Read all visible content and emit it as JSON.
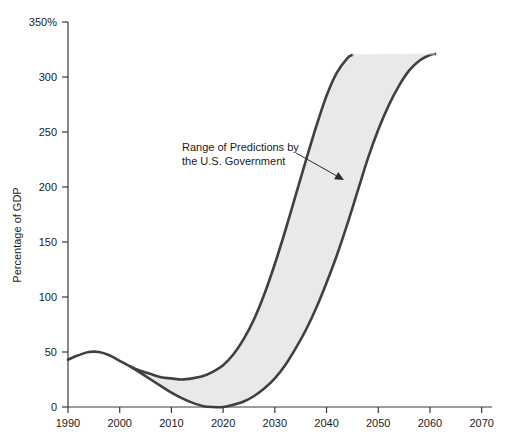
{
  "chart_data": {
    "type": "area",
    "title": "",
    "subtitle": "",
    "xlabel": "",
    "ylabel": "Percentage of GDP",
    "xlim": [
      1990,
      2072
    ],
    "ylim": [
      0,
      350
    ],
    "grid": false,
    "legend_position": "none",
    "x_ticks": [
      1990,
      2000,
      2010,
      2020,
      2030,
      2040,
      2050,
      2060,
      2070
    ],
    "x_tick_labels": [
      "1990",
      "2000",
      "2010",
      "2020",
      "2030",
      "2040",
      "2050",
      "2060",
      "2070"
    ],
    "y_ticks": [
      0,
      50,
      100,
      150,
      200,
      250,
      300,
      350
    ],
    "y_tick_labels": [
      "0",
      "50",
      "100",
      "150",
      "200",
      "250",
      "300",
      "350%"
    ],
    "band_fill_color": "#e9e9e9",
    "line_color": "#404040",
    "axis_color": "#3a3a3a",
    "series": [
      {
        "name": "Historical / Upper Bound of Predictions",
        "role": "upper",
        "x": [
          1990,
          1992,
          1994,
          1996,
          1998,
          2000,
          2002,
          2004,
          2006,
          2008,
          2010,
          2012,
          2014,
          2016,
          2018,
          2020,
          2022,
          2024,
          2026,
          2028,
          2030,
          2032,
          2034,
          2036,
          2038,
          2040,
          2042,
          2044,
          2045
        ],
        "values": [
          43,
          47,
          50,
          50,
          47,
          42,
          37,
          33,
          30,
          27,
          26,
          25,
          26,
          28,
          32,
          38,
          48,
          62,
          80,
          103,
          130,
          160,
          192,
          224,
          255,
          283,
          304,
          317,
          320
        ]
      },
      {
        "name": "Lower Bound of Predictions",
        "role": "lower",
        "x": [
          2002,
          2004,
          2006,
          2008,
          2010,
          2012,
          2014,
          2016,
          2018,
          2020,
          2022,
          2024,
          2026,
          2028,
          2030,
          2032,
          2034,
          2036,
          2038,
          2040,
          2042,
          2044,
          2046,
          2048,
          2050,
          2052,
          2054,
          2056,
          2058,
          2060,
          2061
        ],
        "values": [
          37,
          31,
          25,
          19,
          13,
          8,
          4,
          1,
          0,
          0,
          2,
          5,
          10,
          17,
          26,
          38,
          53,
          70,
          90,
          113,
          138,
          166,
          196,
          226,
          252,
          274,
          292,
          306,
          315,
          320,
          321
        ]
      }
    ],
    "annotations": [
      {
        "id": "range-of-predictions",
        "text_line_1": "Range of Predictions by",
        "text_line_2": "the U.S. Government",
        "text_x": 182,
        "text_y": 151,
        "arrow_from_x": 296,
        "arrow_from_y": 153,
        "arrow_to_x": 344,
        "arrow_to_y": 180
      }
    ]
  }
}
